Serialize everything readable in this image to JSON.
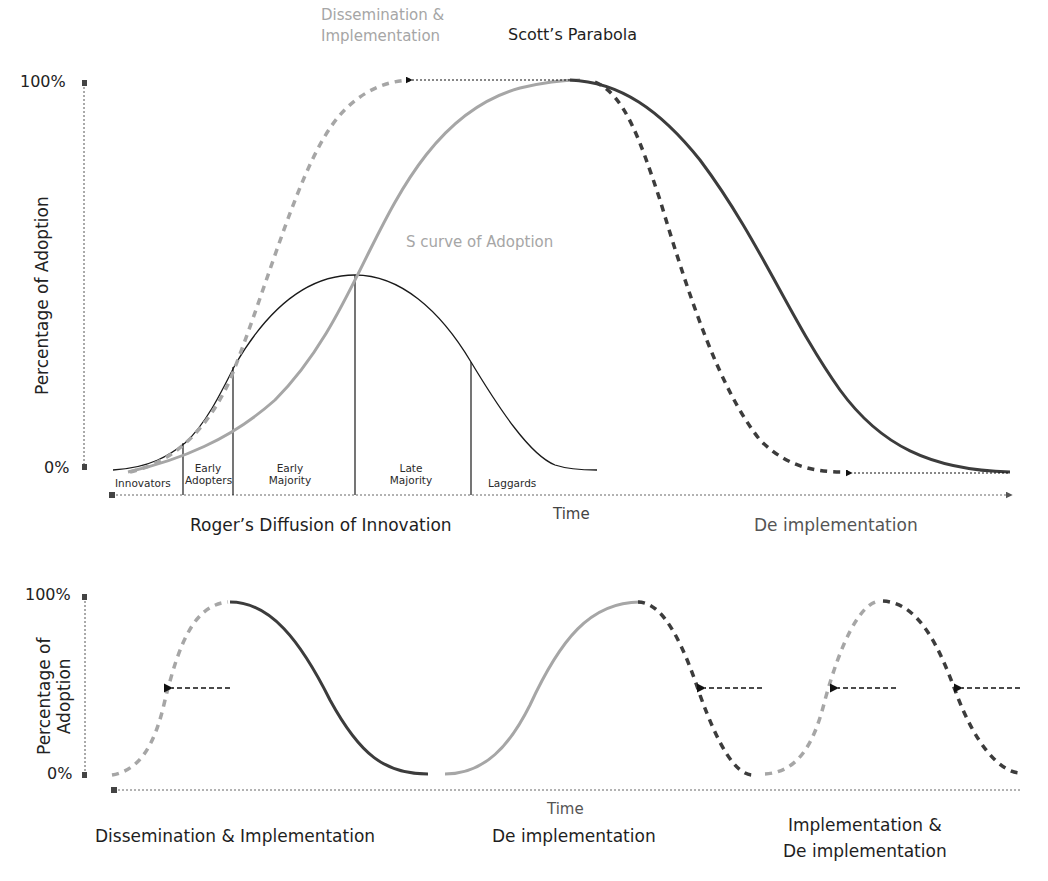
{
  "top_chart": {
    "title": "Scott’s Parabola",
    "y_axis_label": "Percentage of Adoption",
    "y_ticks": [
      "100%",
      "0%"
    ],
    "x_axis_label": "Time",
    "dissemination_label_line1": "Dissemination &",
    "dissemination_label_line2": "Implementation",
    "s_curve_label": "S curve of Adoption",
    "rogers_label": "Roger’s Diffusion of Innovation",
    "deimplementation_label": "De implementation",
    "segments": [
      {
        "line1": "",
        "line2": "Innovators"
      },
      {
        "line1": "Early",
        "line2": "Adopters"
      },
      {
        "line1": "Early",
        "line2": "Majority"
      },
      {
        "line1": "Late",
        "line2": "Majority"
      },
      {
        "line1": "",
        "line2": "Laggards"
      }
    ]
  },
  "bottom_chart": {
    "y_axis_label_line1": "Percentage of",
    "y_axis_label_line2": "Adoption",
    "y_ticks": [
      "100%",
      "0%"
    ],
    "x_axis_label": "Time",
    "phase_labels": {
      "phase1": "Dissemination & Implementation",
      "phase2": "De implementation",
      "phase3_line1": "Implementation &",
      "phase3_line2": "De implementation"
    }
  },
  "colors": {
    "light_curve": "#a6a6a6",
    "dark_curve": "#3c3c3c",
    "bell_curve": "#1a1a1a",
    "axis": "#444444"
  }
}
